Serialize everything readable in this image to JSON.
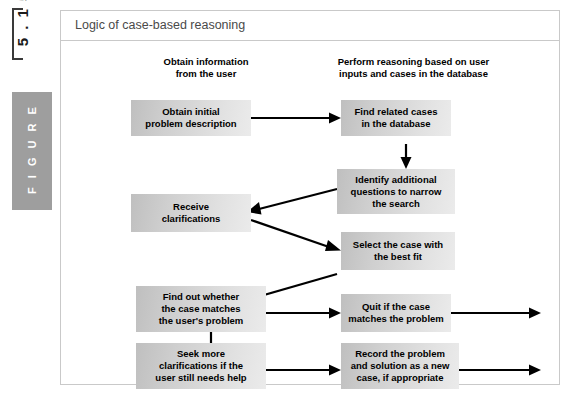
{
  "marginalia": {
    "figure_number": "5 . 1 5",
    "figure_label": "F I G U R E"
  },
  "figure": {
    "title": "Logic of case-based reasoning",
    "columns": [
      {
        "name": "obtain-information",
        "line1": "Obtain information",
        "line2": "from the user"
      },
      {
        "name": "perform-reasoning",
        "line1": "Perform reasoning based on user",
        "line2": "inputs and cases in the database"
      }
    ],
    "nodes": [
      {
        "id": "obtain-initial-problem-description",
        "lines": [
          "Obtain initial",
          "problem description"
        ]
      },
      {
        "id": "find-related-cases",
        "lines": [
          "Find related cases",
          "in the database"
        ]
      },
      {
        "id": "identify-additional-questions",
        "lines": [
          "Identify additional",
          "questions to narrow",
          "the search"
        ]
      },
      {
        "id": "receive-clarifications",
        "lines": [
          "Receive",
          "clarifications"
        ]
      },
      {
        "id": "select-the-case",
        "lines": [
          "Select the case with",
          "the best fit"
        ]
      },
      {
        "id": "find-out-whether-case-matches",
        "lines": [
          "Find out whether",
          "the case matches",
          "the user's problem"
        ]
      },
      {
        "id": "quit-if-case-matches",
        "lines": [
          "Quit if the case",
          "matches the problem"
        ]
      },
      {
        "id": "seek-more-clarifications",
        "lines": [
          "Seek more",
          "clarifications if the",
          "user still needs help"
        ]
      },
      {
        "id": "record-the-problem",
        "lines": [
          "Record the problem",
          "and solution as a new",
          "case, if appropriate"
        ]
      }
    ],
    "colors": {
      "node_fill_dark": "#bfbfbf",
      "node_fill_light": "#ebebeb",
      "frame_border": "#c9c9c9",
      "title_text": "#4a4a4a",
      "marginalia_block": "#9e9e9e",
      "connector": "#000000"
    }
  }
}
